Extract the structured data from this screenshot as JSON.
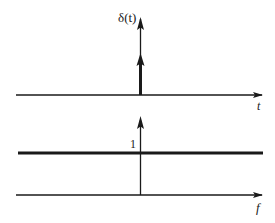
{
  "diagram": {
    "top_panel": {
      "signal_label": "δ(t)",
      "axis_label": "t",
      "description": "Unit impulse at t = 0"
    },
    "bottom_panel": {
      "level_label": "1",
      "axis_label": "f",
      "description": "Flat spectrum of amplitude 1 for all f"
    },
    "colors": {
      "ink": "#1a1a1a",
      "background": "#ffffff"
    }
  }
}
